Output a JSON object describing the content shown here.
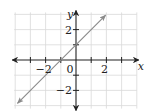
{
  "chart_data": {
    "type": "line",
    "title": "",
    "xlabel": "x",
    "ylabel": "y",
    "xlim": [
      -4,
      4
    ],
    "ylim": [
      -3,
      3
    ],
    "grid": true,
    "x_ticks": [
      -3,
      -2,
      -1,
      1,
      2,
      3
    ],
    "y_ticks": [
      -2,
      -1,
      1,
      2
    ],
    "x_tick_labels": [
      {
        "value": -2,
        "text": "−2"
      },
      {
        "value": 2,
        "text": "2"
      }
    ],
    "y_tick_labels": [
      {
        "value": 2,
        "text": "2"
      },
      {
        "value": -2,
        "text": "−2"
      }
    ],
    "origin_label": "0",
    "series": [
      {
        "name": "y = x + 1",
        "equation": "y = x + 1",
        "x": [
          -3.85,
          1.95
        ],
        "y": [
          -2.85,
          2.95
        ],
        "arrows": "both",
        "color": "#8a8a8a"
      }
    ]
  }
}
